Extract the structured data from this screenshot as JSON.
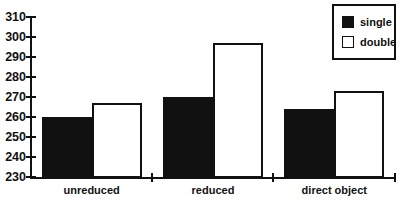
{
  "chart_data": {
    "type": "bar",
    "categories": [
      "unreduced",
      "reduced",
      "direct object"
    ],
    "series": [
      {
        "name": "single",
        "color": "#111111",
        "values": [
          260,
          270,
          264
        ]
      },
      {
        "name": "double",
        "color": "#ffffff",
        "values": [
          267,
          297,
          273
        ]
      }
    ],
    "title": "",
    "xlabel": "",
    "ylabel": "",
    "ylim": [
      230,
      310
    ],
    "yticks": [
      230,
      240,
      250,
      260,
      270,
      280,
      290,
      300,
      310
    ],
    "grid": false,
    "legend_position": "top-right"
  },
  "colors": {
    "background": "#ffffff",
    "axis": "#111111",
    "bar_fill_single": "#111111",
    "bar_fill_double": "#ffffff",
    "bar_border": "#111111"
  }
}
